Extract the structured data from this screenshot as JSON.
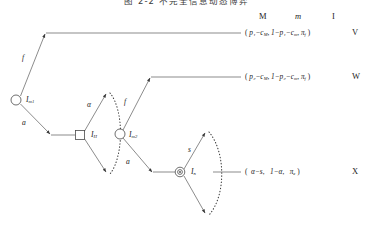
{
  "figure": {
    "title": "图 2-2  不完全信息动态博弈",
    "type": "extensive-form-game-tree"
  },
  "column_headers": [
    {
      "label": "M",
      "x": 262,
      "y": 11
    },
    {
      "label": "m",
      "x": 297,
      "y": 11
    },
    {
      "label": "I",
      "x": 333,
      "y": 11
    }
  ],
  "nodes": [
    {
      "id": "root",
      "shape": "open-circle",
      "label": "I",
      "sub": "m1",
      "x": 16,
      "y": 100,
      "r": 5.0
    },
    {
      "id": "square",
      "shape": "square",
      "label": "I",
      "sub": "H",
      "x": 80,
      "y": 135,
      "r": 4.6
    },
    {
      "id": "mid",
      "shape": "open-circle",
      "label": "I",
      "sub": "m2",
      "x": 120,
      "y": 134,
      "r": 5.0
    },
    {
      "id": "double",
      "shape": "double-circle",
      "label": "I",
      "sub": "n",
      "x": 180,
      "y": 172,
      "r": 4.8
    }
  ],
  "branch_labels": [
    {
      "label": "f",
      "x": 25,
      "y": 57
    },
    {
      "label": "a",
      "x": 25,
      "y": 122
    },
    {
      "label": "α",
      "x": 90,
      "y": 104
    },
    {
      "label": "f",
      "x": 126,
      "y": 101
    },
    {
      "label": "a",
      "x": 128,
      "y": 160
    },
    {
      "label": "s",
      "x": 190,
      "y": 148
    }
  ],
  "node_labels": [
    {
      "label": "I",
      "sub": "m1",
      "x": 27,
      "y": 98
    },
    {
      "label": "I",
      "sub": "H",
      "x": 92,
      "y": 133
    },
    {
      "label": "I",
      "sub": "m2",
      "x": 130,
      "y": 133
    },
    {
      "label": "I",
      "sub": "n",
      "x": 192,
      "y": 170
    }
  ],
  "payoffs": [
    {
      "id": "V",
      "y": 33,
      "text": "( p₁−cₘ, 1−p₁−cₘ, πf )",
      "parts": {
        "open": "(",
        "M": "p₁−c",
        "M_sub": "M",
        "m": "1−p₁−c",
        "m_sub": "m",
        "I": "π",
        "I_sub": "f",
        "close": ")"
      },
      "outcome": "V"
    },
    {
      "id": "W",
      "y": 77,
      "text": "( p₂−cₘ, 1−p₂−cₘ, πf )",
      "parts": {
        "open": "(",
        "M": "p₂−c",
        "M_sub": "M",
        "m": "1−p₂−c",
        "m_sub": "m",
        "I": "π",
        "I_sub": "f",
        "close": ")"
      },
      "outcome": "W"
    },
    {
      "id": "X",
      "y": 172,
      "text": "(  α−s,    1−α,    πₑ )",
      "parts": {
        "open": "(",
        "M": "α−s",
        "M_sub": "",
        "m": "1−α",
        "m_sub": "",
        "I": "π",
        "I_sub": "e",
        "close": ")"
      },
      "outcome": "X"
    }
  ],
  "colors": {
    "line": "#5a5a5a",
    "text": "#1a1a1a",
    "dotted": "#3f3f3f"
  }
}
